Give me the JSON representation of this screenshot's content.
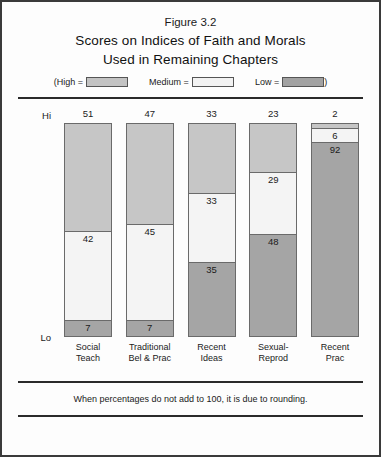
{
  "figure": {
    "number": "Figure 3.2",
    "title_line1": "Scores on Indices of Faith and Morals",
    "title_line2": "Used in Remaining Chapters",
    "footnote": "When percentages do not add to 100, it is due to rounding."
  },
  "legend": {
    "paren_open": "(",
    "paren_close": ")",
    "entries": [
      {
        "label": "High =",
        "swatch": "high-swatch",
        "color": "#c3c3c3"
      },
      {
        "label": "Medium =",
        "swatch": "medium-swatch",
        "color": "#f2f2f2"
      },
      {
        "label": "Low =",
        "swatch": "low-swatch",
        "color": "#a2a2a2"
      }
    ]
  },
  "axis": {
    "top_label": "Hi",
    "bottom_label": "Lo"
  },
  "chart_data": {
    "type": "bar",
    "subtype": "stacked-bar-100-percent",
    "title": "Scores on Indices of Faith and Morals Used in Remaining Chapters",
    "xlabel": "",
    "ylabel": "",
    "ylim": [
      0,
      100
    ],
    "grid": false,
    "legend_position": "top",
    "orientation": "vertical",
    "categories": [
      "Social\nTeach",
      "Traditional\nBel & Prac",
      "Recent\nIdeas",
      "Sexual-\nReprod",
      "Recent\nPrac"
    ],
    "category_lines": [
      [
        "Social",
        "Teach"
      ],
      [
        "Traditional",
        "Bel & Prac"
      ],
      [
        "Recent",
        "Ideas"
      ],
      [
        "Sexual-",
        "Reprod"
      ],
      [
        "Recent",
        "Prac"
      ]
    ],
    "series": [
      {
        "name": "High",
        "color": "#c6c6c6",
        "values": [
          51,
          47,
          33,
          23,
          2
        ]
      },
      {
        "name": "Medium",
        "color": "#f4f4f4",
        "values": [
          42,
          45,
          33,
          29,
          6
        ]
      },
      {
        "name": "Low",
        "color": "#a5a5a5",
        "values": [
          7,
          7,
          35,
          48,
          92
        ]
      }
    ],
    "bars": [
      {
        "category": "Social Teach",
        "top_value_label": "51",
        "segments": [
          {
            "level": "High",
            "value": 51,
            "label": "51",
            "label_shown_inside": false
          },
          {
            "level": "Medium",
            "value": 42,
            "label": "42",
            "label_shown_inside": true
          },
          {
            "level": "Low",
            "value": 7,
            "label": "7",
            "label_shown_inside": true
          }
        ]
      },
      {
        "category": "Traditional Bel & Prac",
        "top_value_label": "47",
        "segments": [
          {
            "level": "High",
            "value": 47,
            "label": "47",
            "label_shown_inside": false
          },
          {
            "level": "Medium",
            "value": 45,
            "label": "45",
            "label_shown_inside": true
          },
          {
            "level": "Low",
            "value": 7,
            "label": "7",
            "label_shown_inside": true
          }
        ]
      },
      {
        "category": "Recent Ideas",
        "top_value_label": "33",
        "segments": [
          {
            "level": "High",
            "value": 33,
            "label": "33",
            "label_shown_inside": false
          },
          {
            "level": "Medium",
            "value": 33,
            "label": "33",
            "label_shown_inside": true
          },
          {
            "level": "Low",
            "value": 35,
            "label": "35",
            "label_shown_inside": true
          }
        ]
      },
      {
        "category": "Sexual-Reprod",
        "top_value_label": "23",
        "segments": [
          {
            "level": "High",
            "value": 23,
            "label": "23",
            "label_shown_inside": false
          },
          {
            "level": "Medium",
            "value": 29,
            "label": "29",
            "label_shown_inside": true
          },
          {
            "level": "Low",
            "value": 48,
            "label": "48",
            "label_shown_inside": true
          }
        ]
      },
      {
        "category": "Recent Prac",
        "top_value_label": "2",
        "segments": [
          {
            "level": "High",
            "value": 2,
            "label": "2",
            "label_shown_inside": false
          },
          {
            "level": "Medium",
            "value": 6,
            "label": "6",
            "label_shown_inside": true
          },
          {
            "level": "Low",
            "value": 92,
            "label": "92",
            "label_shown_inside": true
          }
        ]
      }
    ]
  }
}
